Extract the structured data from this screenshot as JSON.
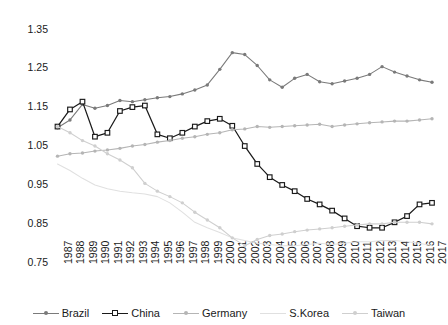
{
  "chart_data": {
    "type": "line",
    "title": "",
    "xlabel": "",
    "ylabel": "",
    "ylim": [
      0.75,
      1.35
    ],
    "yticks": [
      0.75,
      0.85,
      0.95,
      1.05,
      1.15,
      1.25,
      1.35
    ],
    "ytick_labels": [
      "0.75",
      "0.85",
      "0.95",
      "1.05",
      "1.15",
      "1.25",
      "1.35"
    ],
    "grid": false,
    "legend_position": "bottom",
    "categories": [
      "1987",
      "1988",
      "1989",
      "1990",
      "1991",
      "1992",
      "1993",
      "1994",
      "1995",
      "1996",
      "1997",
      "1998",
      "1999",
      "2000",
      "2001",
      "2002",
      "2003",
      "2004",
      "2005",
      "2006",
      "2007",
      "2008",
      "2009",
      "2010",
      "2011",
      "2012",
      "2013",
      "2014",
      "2015",
      "2016",
      "2017"
    ],
    "series": [
      {
        "name": "Brazil",
        "color": "#7a7a7a",
        "marker": "dot",
        "values": [
          1.095,
          1.115,
          1.155,
          1.145,
          1.152,
          1.165,
          1.162,
          1.167,
          1.172,
          1.175,
          1.182,
          1.192,
          1.205,
          1.245,
          1.288,
          1.283,
          1.255,
          1.218,
          1.199,
          1.222,
          1.232,
          1.213,
          1.208,
          1.215,
          1.222,
          1.232,
          1.252,
          1.238,
          1.228,
          1.218,
          1.212
        ]
      },
      {
        "name": "China",
        "color": "#1a1a1a",
        "marker": "square",
        "values": [
          1.098,
          1.142,
          1.162,
          1.072,
          1.082,
          1.138,
          1.148,
          1.152,
          1.078,
          1.068,
          1.082,
          1.098,
          1.112,
          1.118,
          1.1,
          1.048,
          1.002,
          0.968,
          0.948,
          0.932,
          0.912,
          0.898,
          0.882,
          0.862,
          0.842,
          0.838,
          0.838,
          0.852,
          0.868,
          0.898,
          0.902
        ]
      },
      {
        "name": "Germany",
        "color": "#b5b5b5",
        "marker": "dot",
        "values": [
          1.022,
          1.028,
          1.03,
          1.035,
          1.038,
          1.042,
          1.048,
          1.052,
          1.058,
          1.062,
          1.068,
          1.072,
          1.078,
          1.082,
          1.09,
          1.092,
          1.098,
          1.096,
          1.098,
          1.1,
          1.102,
          1.104,
          1.098,
          1.102,
          1.105,
          1.108,
          1.11,
          1.112,
          1.112,
          1.115,
          1.118
        ]
      },
      {
        "name": "S.Korea",
        "color": "#e0e0e0",
        "marker": "none",
        "values": [
          1.002,
          0.985,
          0.965,
          0.948,
          0.938,
          0.932,
          0.928,
          0.925,
          0.918,
          0.902,
          0.878,
          0.852,
          0.838,
          0.826,
          0.812,
          0.805,
          0.798,
          0.795,
          0.792,
          0.792,
          0.795,
          0.798,
          0.795,
          0.798,
          0.802,
          0.802,
          0.805,
          0.805,
          0.802,
          0.798,
          0.792
        ]
      },
      {
        "name": "Taiwan",
        "color": "#cfcfcf",
        "marker": "dot",
        "values": [
          1.098,
          1.082,
          1.062,
          1.048,
          1.028,
          1.012,
          0.992,
          0.952,
          0.932,
          0.918,
          0.902,
          0.878,
          0.858,
          0.838,
          0.812,
          0.792,
          0.808,
          0.818,
          0.822,
          0.828,
          0.832,
          0.835,
          0.838,
          0.842,
          0.845,
          0.848,
          0.848,
          0.852,
          0.852,
          0.852,
          0.848
        ]
      }
    ]
  },
  "legend": {
    "items": [
      {
        "label": "Brazil"
      },
      {
        "label": "China"
      },
      {
        "label": "Germany"
      },
      {
        "label": "S.Korea"
      },
      {
        "label": "Taiwan"
      }
    ]
  }
}
